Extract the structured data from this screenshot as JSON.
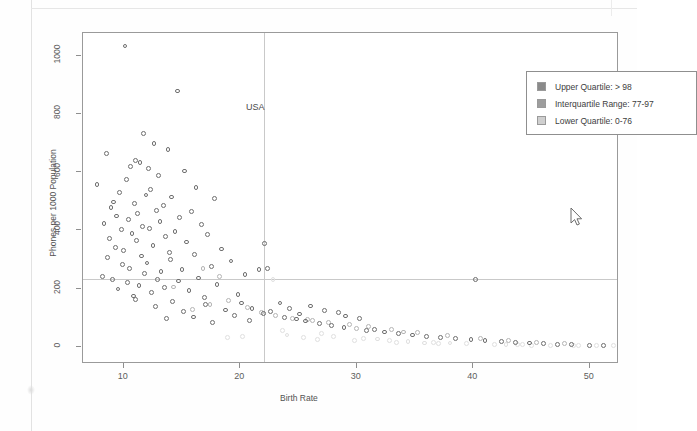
{
  "chart_data": {
    "type": "scatter",
    "title": "",
    "xlabel": "Birth Rate",
    "ylabel": "Phones per 1000 Population",
    "xlim": [
      6.5,
      52.5
    ],
    "ylim": [
      -60,
      1080
    ],
    "xticks": [
      10,
      20,
      30,
      40,
      50
    ],
    "yticks": [
      0,
      200,
      400,
      600,
      800,
      1000
    ],
    "grid": false,
    "annotations": [
      {
        "text": "USA",
        "x": 14.6,
        "y": 905
      }
    ],
    "reference_lines": [
      {
        "orientation": "vertical",
        "x": 22.0
      },
      {
        "orientation": "horizontal",
        "y": 232
      }
    ],
    "legend": {
      "position": "top-right",
      "entries": [
        {
          "label": "Upper Quartile:  > 98",
          "color": "#8a8a8a"
        },
        {
          "label": "Interquartile Range: 77-97",
          "color": "#9d9d9d"
        },
        {
          "label": "Lower Quartile: 0-76",
          "color": "#cfcfcf"
        }
      ]
    },
    "series": [
      {
        "name": "Upper Quartile: > 98",
        "color": "#6e6e6e",
        "points": [
          [
            10.1,
            1035
          ],
          [
            14.6,
            880
          ],
          [
            11.7,
            735
          ],
          [
            12.6,
            700
          ],
          [
            13.8,
            680
          ],
          [
            8.5,
            665
          ],
          [
            11.0,
            640
          ],
          [
            11.4,
            635
          ],
          [
            10.6,
            620
          ],
          [
            12.1,
            612
          ],
          [
            15.2,
            605
          ],
          [
            13.0,
            590
          ],
          [
            10.2,
            575
          ],
          [
            7.7,
            558
          ],
          [
            16.2,
            548
          ],
          [
            12.3,
            540
          ],
          [
            9.6,
            530
          ],
          [
            11.9,
            522
          ],
          [
            14.1,
            515
          ],
          [
            17.8,
            510
          ],
          [
            9.1,
            498
          ],
          [
            10.9,
            492
          ],
          [
            13.4,
            486
          ],
          [
            8.9,
            478
          ],
          [
            12.8,
            470
          ],
          [
            15.8,
            465
          ],
          [
            11.2,
            458
          ],
          [
            9.4,
            450
          ],
          [
            14.8,
            444
          ],
          [
            10.4,
            438
          ],
          [
            13.1,
            432
          ],
          [
            8.3,
            425
          ],
          [
            16.7,
            420
          ],
          [
            11.6,
            414
          ],
          [
            12.2,
            408
          ],
          [
            9.8,
            402
          ],
          [
            14.4,
            396
          ],
          [
            10.7,
            390
          ],
          [
            17.2,
            385
          ],
          [
            13.6,
            378
          ],
          [
            8.8,
            372
          ],
          [
            11.1,
            366
          ],
          [
            15.4,
            360
          ],
          [
            22.1,
            355
          ],
          [
            12.5,
            348
          ],
          [
            9.3,
            342
          ],
          [
            18.4,
            336
          ],
          [
            10.0,
            330
          ],
          [
            13.9,
            325
          ],
          [
            16.1,
            318
          ],
          [
            11.5,
            312
          ],
          [
            8.6,
            306
          ],
          [
            14.0,
            300
          ],
          [
            19.2,
            295
          ],
          [
            12.0,
            288
          ],
          [
            9.9,
            282
          ],
          [
            17.5,
            276
          ],
          [
            10.5,
            270
          ],
          [
            15.0,
            265
          ],
          [
            13.2,
            258
          ],
          [
            11.8,
            252
          ],
          [
            20.4,
            248
          ],
          [
            8.2,
            242
          ],
          [
            16.4,
            236
          ],
          [
            9.0,
            230
          ],
          [
            12.9,
            232
          ],
          [
            14.7,
            226
          ],
          [
            10.3,
            220
          ],
          [
            18.0,
            215
          ],
          [
            11.3,
            210
          ],
          [
            21.6,
            265
          ],
          [
            22.3,
            270
          ],
          [
            13.5,
            204
          ],
          [
            9.5,
            198
          ],
          [
            15.6,
            192
          ],
          [
            12.4,
            186
          ],
          [
            19.8,
            180
          ],
          [
            10.8,
            174
          ],
          [
            16.9,
            168
          ],
          [
            11.0,
            162
          ],
          [
            14.2,
            156
          ],
          [
            20.1,
            150
          ],
          [
            17.0,
            144
          ],
          [
            12.7,
            138
          ],
          [
            21.0,
            132
          ],
          [
            18.7,
            126
          ],
          [
            15.1,
            120
          ],
          [
            22.0,
            115
          ],
          [
            19.5,
            108
          ],
          [
            16.0,
            102
          ],
          [
            13.7,
            96
          ],
          [
            20.8,
            90
          ],
          [
            17.6,
            84
          ],
          [
            23.4,
            150
          ],
          [
            24.2,
            130
          ],
          [
            22.6,
            120
          ],
          [
            25.1,
            112
          ],
          [
            23.8,
            100
          ],
          [
            26.0,
            140
          ],
          [
            24.8,
            95
          ],
          [
            27.2,
            125
          ],
          [
            25.6,
            88
          ],
          [
            28.4,
            118
          ],
          [
            26.8,
            80
          ],
          [
            29.0,
            105
          ],
          [
            27.8,
            72
          ],
          [
            30.2,
            98
          ],
          [
            28.9,
            66
          ],
          [
            31.5,
            60
          ],
          [
            30.8,
            55
          ],
          [
            32.4,
            50
          ],
          [
            33.6,
            45
          ],
          [
            34.8,
            40
          ],
          [
            36.0,
            35
          ],
          [
            37.2,
            30
          ],
          [
            38.5,
            28
          ],
          [
            39.8,
            25
          ],
          [
            40.2,
            230
          ],
          [
            41.0,
            20
          ],
          [
            42.4,
            18
          ],
          [
            43.6,
            15
          ],
          [
            44.8,
            12
          ],
          [
            46.0,
            10
          ],
          [
            47.2,
            8
          ],
          [
            48.4,
            6
          ],
          [
            50.0,
            5
          ],
          [
            51.2,
            4
          ]
        ]
      },
      {
        "name": "Interquartile Range: 77-97",
        "color": "#b4b4b4",
        "points": [
          [
            16.8,
            270
          ],
          [
            18.2,
            240
          ],
          [
            14.3,
            205
          ],
          [
            19.0,
            160
          ],
          [
            17.4,
            145
          ],
          [
            20.6,
            135
          ],
          [
            15.9,
            128
          ],
          [
            21.8,
            118
          ],
          [
            23.0,
            108
          ],
          [
            24.5,
            98
          ],
          [
            26.2,
            90
          ],
          [
            27.6,
            82
          ],
          [
            29.4,
            75
          ],
          [
            31.0,
            68
          ],
          [
            33.0,
            58
          ],
          [
            35.2,
            48
          ],
          [
            37.8,
            38
          ],
          [
            40.6,
            28
          ],
          [
            43.0,
            20
          ],
          [
            45.4,
            14
          ],
          [
            47.8,
            10
          ],
          [
            34.0,
            50
          ],
          [
            30.0,
            62
          ],
          [
            25.8,
            92
          ]
        ]
      },
      {
        "name": "Lower Quartile: 0-76",
        "color": "#e0e0e0",
        "points": [
          [
            22.8,
            232
          ],
          [
            24.0,
            40
          ],
          [
            25.4,
            30
          ],
          [
            28.0,
            35
          ],
          [
            30.6,
            28
          ],
          [
            32.8,
            22
          ],
          [
            34.4,
            18
          ],
          [
            36.6,
            15
          ],
          [
            38.0,
            12
          ],
          [
            39.4,
            10
          ],
          [
            41.8,
            8
          ],
          [
            44.2,
            6
          ],
          [
            46.6,
            5
          ],
          [
            49.0,
            4
          ],
          [
            50.6,
            3
          ],
          [
            20.2,
            36
          ],
          [
            18.9,
            30
          ],
          [
            26.6,
            25
          ],
          [
            29.8,
            20
          ],
          [
            33.4,
            14
          ],
          [
            35.8,
            12
          ],
          [
            42.8,
            6
          ],
          [
            45.0,
            5
          ],
          [
            48.6,
            4
          ],
          [
            52.0,
            3
          ],
          [
            23.6,
            55
          ],
          [
            27.0,
            45
          ],
          [
            31.8,
            26
          ],
          [
            37.0,
            10
          ],
          [
            43.8,
            7
          ]
        ]
      }
    ]
  },
  "axes": {
    "x_title": "Birth Rate",
    "y_title": "Phones per 1000 Population",
    "x_ticks": [
      "10",
      "20",
      "30",
      "40",
      "50"
    ],
    "y_ticks": [
      "0",
      "200",
      "400",
      "600",
      "800",
      "1000"
    ]
  },
  "legend": {
    "entries": [
      {
        "label": "Upper Quartile:  > 98"
      },
      {
        "label": "Interquartile Range: 77-97"
      },
      {
        "label": "Lower Quartile: 0-76"
      }
    ]
  },
  "annotation": {
    "usa": "USA"
  },
  "cursor": {
    "name": "mouse-pointer"
  }
}
